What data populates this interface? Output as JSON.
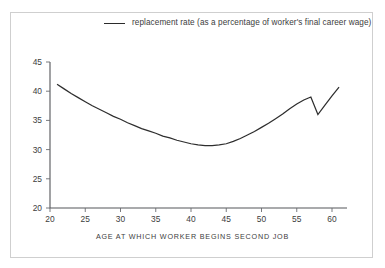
{
  "figure": {
    "background_color": "#ffffff",
    "frame_color": "#cfcfcf",
    "line_color": "#2e2e2e",
    "axis_color": "#55565a",
    "text_color": "#3d3d3d"
  },
  "legend": {
    "position": "top-center",
    "entry_label": "replacement rate (as a percentage of worker's final career wage)"
  },
  "axes": {
    "x_title": "AGE AT WHICH WORKER BEGINS SECOND JOB",
    "y_title": ""
  },
  "chart_data": {
    "type": "line",
    "title": "",
    "subtitle": "",
    "xlabel": "AGE AT WHICH WORKER BEGINS SECOND JOB",
    "ylabel": "",
    "xlim": [
      20,
      61.5
    ],
    "ylim": [
      20,
      45
    ],
    "xticks": [
      20,
      25,
      30,
      35,
      40,
      45,
      50,
      55,
      60
    ],
    "yticks": [
      20,
      25,
      30,
      35,
      40,
      45
    ],
    "xtick_labels": [
      "20",
      "25",
      "30",
      "35",
      "40",
      "45",
      "50",
      "55",
      "60"
    ],
    "ytick_labels": [
      "20",
      "25",
      "30",
      "35",
      "40",
      "45"
    ],
    "grid": false,
    "legend_position": "top-center",
    "series": [
      {
        "name": "replacement rate (as a percentage of worker's final career wage)",
        "color": "#2e2e2e",
        "x": [
          21.0,
          22.0,
          23.0,
          24.0,
          25.0,
          26.0,
          27.0,
          28.0,
          29.0,
          30.0,
          31.0,
          32.0,
          33.0,
          34.0,
          35.0,
          36.0,
          37.0,
          38.0,
          39.0,
          40.0,
          41.0,
          42.0,
          43.0,
          44.0,
          45.0,
          46.0,
          47.0,
          48.0,
          49.0,
          50.0,
          51.0,
          52.0,
          53.0,
          54.0,
          55.0,
          56.0,
          57.0,
          58.0,
          59.0,
          60.0,
          61.0
        ],
        "y": [
          41.2,
          40.4,
          39.6,
          38.9,
          38.2,
          37.5,
          36.9,
          36.3,
          35.7,
          35.2,
          34.6,
          34.1,
          33.6,
          33.2,
          32.8,
          32.3,
          32.0,
          31.6,
          31.3,
          31.0,
          30.8,
          30.7,
          30.7,
          30.8,
          31.0,
          31.4,
          31.9,
          32.5,
          33.1,
          33.8,
          34.5,
          35.3,
          36.1,
          37.0,
          37.8,
          38.5,
          39.0,
          36.0,
          37.6,
          39.2,
          40.7
        ]
      }
    ],
    "annotations": [
      {
        "label": "local peak before sharp drop",
        "x": 57,
        "y": 39.0
      },
      {
        "label": "notch minimum",
        "x": 58,
        "y": 36.0
      },
      {
        "label": "curve minimum",
        "x": 42.5,
        "y": 30.7
      }
    ]
  }
}
